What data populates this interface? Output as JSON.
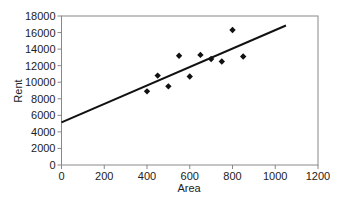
{
  "chart_data": {
    "type": "scatter",
    "title": "",
    "xlabel": "Area",
    "ylabel": "Rent",
    "xlim": [
      0,
      1200
    ],
    "ylim": [
      0,
      18000
    ],
    "x_ticks": [
      0,
      200,
      400,
      600,
      800,
      1000,
      1200
    ],
    "y_ticks": [
      0,
      2000,
      4000,
      6000,
      8000,
      10000,
      12000,
      14000,
      16000,
      18000
    ],
    "grid": false,
    "legend": null,
    "series": [
      {
        "name": "Rent vs Area",
        "marker": "diamond",
        "color": "#111111",
        "points": [
          {
            "x": 400,
            "y": 8900
          },
          {
            "x": 450,
            "y": 10800
          },
          {
            "x": 500,
            "y": 9500
          },
          {
            "x": 550,
            "y": 13200
          },
          {
            "x": 600,
            "y": 10700
          },
          {
            "x": 650,
            "y": 13300
          },
          {
            "x": 700,
            "y": 12800
          },
          {
            "x": 750,
            "y": 12500
          },
          {
            "x": 800,
            "y": 16300
          },
          {
            "x": 850,
            "y": 13100
          }
        ]
      }
    ],
    "trendline": {
      "type": "linear",
      "color": "#111111",
      "start": {
        "x": 0,
        "y": 5150
      },
      "end": {
        "x": 1050,
        "y": 16850
      }
    }
  }
}
